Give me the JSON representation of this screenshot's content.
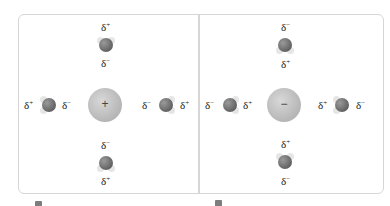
{
  "figure": {
    "left_panel": {
      "central_ion": {
        "charge_symbol": "+",
        "type": "cation"
      },
      "molecules": {
        "top": {
          "label_outer": "δ",
          "label_outer_sup": "+",
          "label_inner": "δ",
          "label_inner_sup": "−"
        },
        "bottom": {
          "label_inner": "δ",
          "label_inner_sup": "−",
          "label_outer": "δ",
          "label_outer_sup": "+"
        },
        "left": {
          "label_outer": "δ",
          "label_outer_sup": "+",
          "label_inner": "δ",
          "label_inner_sup": "−"
        },
        "right": {
          "label_inner": "δ",
          "label_inner_sup": "−",
          "label_outer": "δ",
          "label_outer_sup": "+"
        }
      }
    },
    "right_panel": {
      "central_ion": {
        "charge_symbol": "−",
        "type": "anion"
      },
      "molecules": {
        "top": {
          "label_outer": "δ",
          "label_outer_sup": "−",
          "label_inner": "δ",
          "label_inner_sup": "+"
        },
        "bottom": {
          "label_inner": "δ",
          "label_inner_sup": "+",
          "label_outer": "δ",
          "label_outer_sup": "−"
        },
        "left": {
          "label_outer": "δ",
          "label_outer_sup": "−",
          "label_inner": "δ",
          "label_inner_sup": "+"
        },
        "right": {
          "label_inner": "δ",
          "label_inner_sup": "+",
          "label_outer": "δ",
          "label_outer_sup": "−"
        }
      }
    },
    "colors": {
      "border": "#d6d6d6",
      "ion": "#bdbdbd",
      "oxygen": "#6a6a6a",
      "hydrogen": "#e6e6e6"
    }
  }
}
